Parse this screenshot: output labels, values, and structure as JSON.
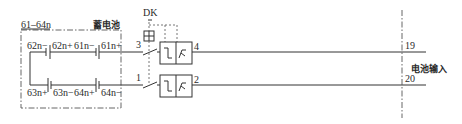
{
  "diagram": {
    "battery_box": {
      "range_label": "61–64n",
      "title": "蓄电池",
      "top_row": [
        "62n−",
        "62n+",
        "61n−",
        "61n+"
      ],
      "bottom_row": [
        "63n+",
        "63n−",
        "64n+",
        "64n−"
      ]
    },
    "switch": {
      "label": "DK",
      "terminals_in": [
        "3",
        "1"
      ],
      "terminals_out": [
        "4",
        "2"
      ]
    },
    "output": {
      "terminals": [
        "19",
        "20"
      ],
      "label": "电池输入"
    }
  }
}
